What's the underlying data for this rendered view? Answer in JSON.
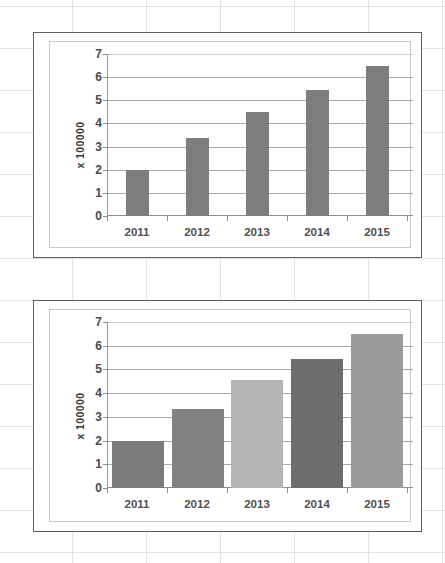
{
  "chart_data": [
    {
      "id": "top",
      "type": "bar",
      "title": "",
      "xlabel": "",
      "ylabel": "x 100000",
      "categories": [
        "2011",
        "2012",
        "2013",
        "2014",
        "2015"
      ],
      "values": [
        2.0,
        3.35,
        4.5,
        5.45,
        6.5
      ],
      "yticks": [
        0,
        1,
        2,
        3,
        4,
        5,
        6,
        7
      ],
      "ylim": [
        0,
        7
      ],
      "grid": true,
      "legend": "none",
      "bar_colors": [
        "#7d7d7d",
        "#7d7d7d",
        "#7d7d7d",
        "#7d7d7d",
        "#7d7d7d"
      ],
      "bar_style": "narrow"
    },
    {
      "id": "bottom",
      "type": "bar",
      "title": "",
      "xlabel": "",
      "ylabel": "x 100000",
      "categories": [
        "2011",
        "2012",
        "2013",
        "2014",
        "2015"
      ],
      "values": [
        2.0,
        3.35,
        4.55,
        5.45,
        6.5
      ],
      "yticks": [
        0,
        1,
        2,
        3,
        4,
        5,
        6,
        7
      ],
      "ylim": [
        0,
        7
      ],
      "grid": true,
      "legend": "none",
      "bar_colors": [
        "#7b7b7b",
        "#828282",
        "#b4b4b4",
        "#6e6e6e",
        "#9a9a9a"
      ],
      "bar_style": "wide"
    }
  ],
  "colors": {
    "panel_border": "#5d5d5d",
    "plot_border": "#c8c8c8",
    "gridline": "#a8a8a8",
    "axis": "#8d8d8d",
    "tick_text": "#4a4a4a",
    "category_text": "#4f4f4f",
    "background": "#ffffff"
  }
}
